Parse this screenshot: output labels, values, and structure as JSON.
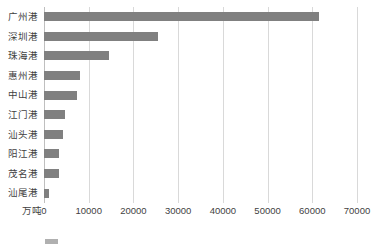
{
  "chart_data": {
    "type": "bar",
    "orientation": "horizontal",
    "title": "",
    "xlabel": "",
    "ylabel": "",
    "unit_label": "万吨",
    "grid": true,
    "legend_position": "none",
    "xlim": [
      0,
      70000
    ],
    "xticks": [
      0,
      10000,
      20000,
      30000,
      40000,
      50000,
      60000,
      70000
    ],
    "xtick_labels": [
      "0",
      "10000",
      "20000",
      "30000",
      "40000",
      "50000",
      "60000",
      "70000"
    ],
    "categories": [
      "广州港",
      "深圳港",
      "珠海港",
      "惠州港",
      "中山港",
      "江门港",
      "汕头港",
      "阳江港",
      "茂名港",
      "汕尾港"
    ],
    "values": [
      61400,
      25430,
      14470,
      7980,
      7450,
      4630,
      4250,
      3280,
      3350,
      1050
    ],
    "series": [
      {
        "name": "港口货物吞吐量",
        "color": "#808080",
        "values": [
          61400,
          25430,
          14470,
          7980,
          7450,
          4630,
          4250,
          3280,
          3350,
          1050
        ]
      }
    ]
  },
  "caption": {
    "text": "",
    "swatch_color": "#b0b0b0"
  },
  "colors": {
    "bar": "#808080",
    "gridline": "#d9d9d9",
    "axis": "#bfbfbf",
    "text": "#3f3f3f"
  }
}
